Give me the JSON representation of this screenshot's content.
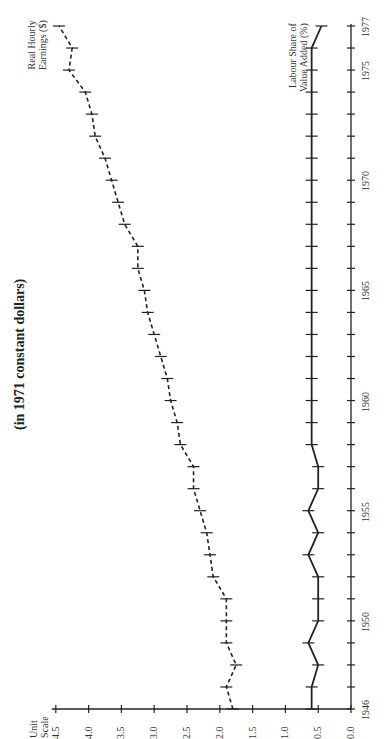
{
  "title": "(in 1971 constant dollars)",
  "unit_label_line1": "Unit",
  "unit_label_line2": "Scale",
  "series_labels": {
    "earnings_line1": "Real Hourly",
    "earnings_line2": "Earnings ($)",
    "labour_line1": "Labour Share of",
    "labour_line2": "Value Added (%)"
  },
  "chart_data": {
    "type": "line",
    "title": "(in 1971 constant dollars)",
    "orientation": "rotated 90° counter-clockwise (years run bottom-to-top, values run right-to-left)",
    "xlabel": "Year",
    "ylabel": "Unit Scale",
    "x": [
      1946,
      1947,
      1948,
      1949,
      1950,
      1951,
      1952,
      1953,
      1954,
      1955,
      1956,
      1957,
      1958,
      1959,
      1960,
      1961,
      1962,
      1963,
      1964,
      1965,
      1966,
      1967,
      1968,
      1969,
      1970,
      1971,
      1972,
      1973,
      1974,
      1975,
      1976,
      1977
    ],
    "x_tick_labels": [
      "1946",
      "1950",
      "1955",
      "1960",
      "1965",
      "1970",
      "1975",
      "1977"
    ],
    "y_tick_labels": [
      "0.0",
      "0.5",
      "1.0",
      "1.5",
      "2.0",
      "2.5",
      "3.0",
      "3.5",
      "4.0",
      "4.5"
    ],
    "ylim": [
      0,
      4.5
    ],
    "grid": false,
    "series": [
      {
        "name": "Real Hourly Earnings ($)",
        "style": "dashed with tick markers",
        "values": [
          1.8,
          1.9,
          1.75,
          1.9,
          1.9,
          1.9,
          2.1,
          2.15,
          2.2,
          2.3,
          2.4,
          2.4,
          2.6,
          2.65,
          2.75,
          2.8,
          2.9,
          3.0,
          3.1,
          3.15,
          3.25,
          3.25,
          3.45,
          3.55,
          3.65,
          3.75,
          3.9,
          3.95,
          4.05,
          4.3,
          4.25,
          4.45
        ]
      },
      {
        "name": "Labour Share of Value Added (%)",
        "style": "solid with tick markers",
        "values": [
          0.6,
          0.6,
          0.5,
          0.65,
          0.5,
          0.5,
          0.5,
          0.65,
          0.5,
          0.65,
          0.5,
          0.5,
          0.6,
          0.6,
          0.6,
          0.6,
          0.6,
          0.6,
          0.6,
          0.6,
          0.6,
          0.6,
          0.6,
          0.6,
          0.6,
          0.6,
          0.6,
          0.6,
          0.6,
          0.6,
          0.6,
          0.45
        ]
      }
    ],
    "legend": "inline labels at top-right of each series"
  }
}
